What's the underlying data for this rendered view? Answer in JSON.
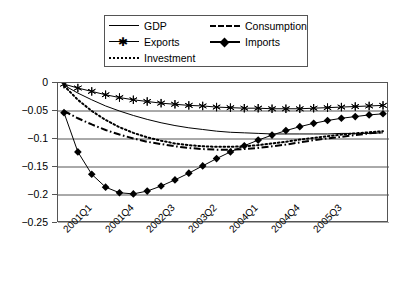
{
  "chart_data": {
    "type": "line",
    "title": "",
    "xlabel": "",
    "ylabel": "",
    "ylim": [
      -0.25,
      0
    ],
    "grid": true,
    "legend_position": "top",
    "yticks": [
      "0",
      "-0.05",
      "-0.1",
      "-0.15",
      "-0.2",
      "-0.25"
    ],
    "ytick_values": [
      0,
      -0.05,
      -0.1,
      -0.15,
      -0.2,
      -0.25
    ],
    "xtick_labels": [
      "2001Q1",
      "2001Q4",
      "2002Q3",
      "2003Q2",
      "2004Q1",
      "2004Q4",
      "2005Q3"
    ],
    "xtick_indices": [
      0,
      3,
      6,
      9,
      12,
      15,
      18
    ],
    "x": [
      "2001Q1",
      "2001Q2",
      "2001Q3",
      "2001Q4",
      "2002Q1",
      "2002Q2",
      "2002Q3",
      "2002Q4",
      "2003Q1",
      "2003Q2",
      "2003Q3",
      "2003Q4",
      "2004Q1",
      "2004Q2",
      "2004Q3",
      "2004Q4",
      "2005Q1",
      "2005Q2",
      "2005Q3",
      "2005Q4",
      "2006Q1",
      "2006Q2",
      "2006Q3",
      "2006Q4"
    ],
    "series": [
      {
        "name": "GDP",
        "style": "solid-thin",
        "marker": "none",
        "color": "#000000",
        "values": [
          -0.004,
          -0.018,
          -0.03,
          -0.041,
          -0.05,
          -0.058,
          -0.065,
          -0.071,
          -0.076,
          -0.08,
          -0.083,
          -0.086,
          -0.088,
          -0.089,
          -0.09,
          -0.091,
          -0.091,
          -0.091,
          -0.091,
          -0.091,
          -0.09,
          -0.09,
          -0.09,
          -0.089
        ]
      },
      {
        "name": "Exports",
        "style": "solid-thin",
        "marker": "star",
        "color": "#000000",
        "values": [
          -0.002,
          -0.009,
          -0.015,
          -0.021,
          -0.026,
          -0.03,
          -0.033,
          -0.036,
          -0.038,
          -0.04,
          -0.041,
          -0.043,
          -0.044,
          -0.045,
          -0.045,
          -0.046,
          -0.046,
          -0.046,
          -0.045,
          -0.044,
          -0.043,
          -0.042,
          -0.041,
          -0.04
        ]
      },
      {
        "name": "Investment",
        "style": "dotted",
        "marker": "none",
        "color": "#000000",
        "values": [
          -0.005,
          -0.03,
          -0.05,
          -0.066,
          -0.079,
          -0.089,
          -0.097,
          -0.103,
          -0.108,
          -0.111,
          -0.113,
          -0.114,
          -0.114,
          -0.113,
          -0.111,
          -0.108,
          -0.105,
          -0.101,
          -0.098,
          -0.095,
          -0.092,
          -0.09,
          -0.088,
          -0.086
        ]
      },
      {
        "name": "Consumption",
        "style": "dash-dot",
        "marker": "none",
        "color": "#000000",
        "values": [
          -0.05,
          -0.063,
          -0.074,
          -0.084,
          -0.092,
          -0.099,
          -0.105,
          -0.109,
          -0.113,
          -0.116,
          -0.118,
          -0.119,
          -0.119,
          -0.118,
          -0.116,
          -0.113,
          -0.11,
          -0.106,
          -0.102,
          -0.099,
          -0.096,
          -0.093,
          -0.09,
          -0.088
        ]
      },
      {
        "name": "Imports",
        "style": "solid-thin",
        "marker": "diamond",
        "color": "#000000",
        "values": [
          -0.053,
          -0.123,
          -0.163,
          -0.186,
          -0.196,
          -0.198,
          -0.193,
          -0.184,
          -0.173,
          -0.161,
          -0.148,
          -0.135,
          -0.123,
          -0.112,
          -0.102,
          -0.093,
          -0.085,
          -0.078,
          -0.072,
          -0.067,
          -0.063,
          -0.06,
          -0.057,
          -0.055
        ]
      }
    ]
  },
  "legend": {
    "items": [
      {
        "label": "GDP"
      },
      {
        "label": "Consumption"
      },
      {
        "label": "Exports"
      },
      {
        "label": "Imports"
      },
      {
        "label": "Investment"
      }
    ]
  }
}
